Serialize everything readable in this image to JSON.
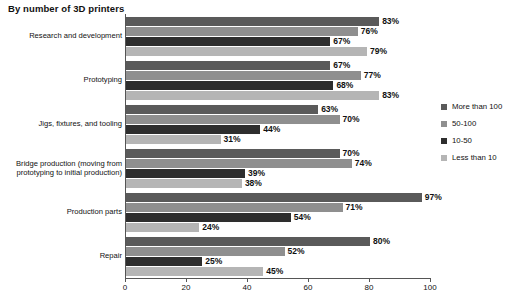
{
  "chart_data": {
    "type": "bar",
    "orientation": "horizontal",
    "title": "By number of 3D printers",
    "xlabel": "",
    "ylabel": "",
    "xlim": [
      0,
      100
    ],
    "x_ticks": [
      0,
      20,
      40,
      60,
      80,
      100
    ],
    "x_tick_labels": [
      "0",
      "20",
      "40",
      "60",
      "80",
      "100"
    ],
    "grid": false,
    "value_suffix": "%",
    "legend_position": "right",
    "categories": [
      "Research and development",
      "Prototyping",
      "Jigs, fixtures, and tooling",
      "Bridge production (moving from prototyping to initial production)",
      "Production parts",
      "Repair"
    ],
    "series": [
      {
        "name": "More than 100",
        "color": "#5a5a5a",
        "values": [
          83,
          67,
          63,
          70,
          97,
          80
        ],
        "labels": [
          "83%",
          "67%",
          "63%",
          "70%",
          "97%",
          "80%"
        ]
      },
      {
        "name": "50-100",
        "color": "#8f8f8f",
        "values": [
          76,
          77,
          70,
          74,
          71,
          52
        ],
        "labels": [
          "76%",
          "77%",
          "70%",
          "74%",
          "71%",
          "52%"
        ]
      },
      {
        "name": "10-50",
        "color": "#2e2e2e",
        "values": [
          67,
          68,
          44,
          39,
          54,
          25
        ],
        "labels": [
          "67%",
          "68%",
          "44%",
          "39%",
          "54%",
          "25%"
        ]
      },
      {
        "name": "Less than 10",
        "color": "#b5b5b5",
        "values": [
          79,
          83,
          31,
          38,
          24,
          45
        ],
        "labels": [
          "79%",
          "83%",
          "31%",
          "38%",
          "24%",
          "45%"
        ]
      }
    ]
  }
}
